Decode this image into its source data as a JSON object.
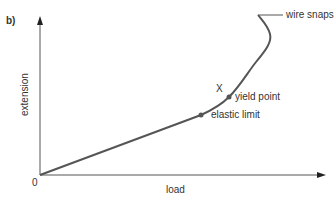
{
  "panel_label": "b)",
  "axes": {
    "x_label": "load",
    "y_label": "extension",
    "origin_label": "0"
  },
  "annotations": {
    "elastic_limit": "elastic limit",
    "yield_point": "yield point",
    "x_marker": "X",
    "wire_snaps": "wire snaps"
  },
  "colors": {
    "curve": "#555555",
    "axis": "#555555",
    "text": "#333333"
  }
}
